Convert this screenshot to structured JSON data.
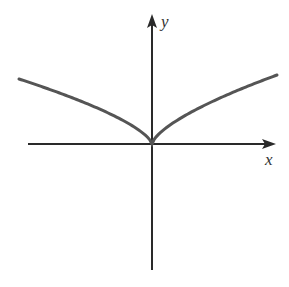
{
  "figure": {
    "x_axis_label": "x",
    "y_axis_label": "y",
    "colors": {
      "axis": "#2a2a2a",
      "curve": "#555555",
      "background": "#ffffff"
    }
  },
  "chart_data": {
    "type": "line",
    "title": "",
    "xlabel": "x",
    "ylabel": "y",
    "grid": false,
    "legend": null,
    "ticks": "none",
    "series": [
      {
        "name": "curve",
        "function": "y = |x|^(2/3)",
        "features": [
          "cusp at origin",
          "even function",
          "increasing for x>0",
          "decreasing for x<0"
        ],
        "x": [
          -1.0,
          -0.75,
          -0.5,
          -0.25,
          -0.1,
          0,
          0.1,
          0.25,
          0.5,
          0.75,
          1.0
        ],
        "y": [
          1.0,
          0.825,
          0.63,
          0.397,
          0.215,
          0,
          0.215,
          0.397,
          0.63,
          0.825,
          1.0
        ]
      }
    ]
  }
}
